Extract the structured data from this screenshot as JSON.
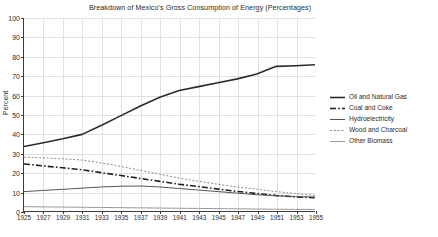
{
  "chart_data": {
    "type": "line",
    "title": "Breakdown of Mexico's Gross Consumption of Energy (Percentages)",
    "xlabel": "",
    "ylabel": "Percent",
    "xlim": [
      1925,
      1955
    ],
    "ylim": [
      0,
      100
    ],
    "grid": true,
    "legend_position": "right",
    "x": [
      1925,
      1927,
      1929,
      1931,
      1933,
      1935,
      1937,
      1939,
      1941,
      1943,
      1945,
      1947,
      1949,
      1951,
      1953,
      1955
    ],
    "xticklabels": [
      "1925",
      "1927",
      "1929",
      "1931",
      "1933",
      "1935",
      "1937",
      "1939",
      "1941",
      "1943",
      "1945",
      "1947",
      "1949",
      "1951",
      "1953",
      "1955"
    ],
    "yticklabels": [
      "0",
      "10",
      "20",
      "30",
      "40",
      "50",
      "60",
      "70",
      "80",
      "90",
      "100"
    ],
    "yticks": [
      0,
      10,
      20,
      30,
      40,
      50,
      60,
      70,
      80,
      90,
      100
    ],
    "series": [
      {
        "name": "Oil and Natural Gas",
        "style": "solid",
        "color": "#2b2b2b",
        "width": 1.6,
        "values": [
          33.5,
          35.5,
          37.5,
          39.8,
          44.5,
          49.5,
          54.5,
          59.0,
          62.5,
          64.5,
          66.5,
          68.5,
          71.0,
          75.0,
          75.3,
          75.8
        ]
      },
      {
        "name": "Coal and Coke",
        "style": "dashdot",
        "color": "#1f1f1f",
        "width": 1.6,
        "values": [
          24.5,
          23.5,
          22.5,
          21.5,
          20.0,
          18.5,
          17.0,
          15.5,
          14.0,
          12.8,
          11.5,
          10.3,
          9.2,
          8.2,
          7.5,
          7.0
        ]
      },
      {
        "name": "Hydroelectricity",
        "style": "solid",
        "color": "#555555",
        "width": 1.0,
        "values": [
          10.2,
          10.8,
          11.4,
          12.0,
          12.6,
          13.0,
          13.1,
          12.6,
          11.8,
          11.0,
          10.2,
          9.4,
          8.6,
          8.0,
          7.6,
          7.4
        ]
      },
      {
        "name": "Wood and Charcoal",
        "style": "dotted",
        "color": "#8a8a8a",
        "width": 1.0,
        "values": [
          28.0,
          27.6,
          27.2,
          26.5,
          25.0,
          23.2,
          21.2,
          19.2,
          17.2,
          15.5,
          14.0,
          12.6,
          11.4,
          10.2,
          9.2,
          8.2
        ]
      },
      {
        "name": "Other Biomass",
        "style": "solid",
        "color": "#9a9a9a",
        "width": 1.0,
        "values": [
          2.4,
          2.3,
          2.2,
          2.1,
          2.0,
          1.9,
          1.8,
          1.7,
          1.6,
          1.5,
          1.4,
          1.3,
          1.2,
          1.1,
          1.0,
          1.0
        ]
      }
    ]
  }
}
